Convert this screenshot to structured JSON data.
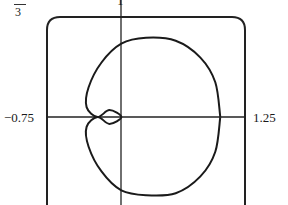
{
  "chart_data": {
    "type": "line",
    "title": "",
    "xlim": [
      -0.75,
      1.25
    ],
    "ylim": [
      -0.9,
      1
    ],
    "x_tick_labels": [
      "-0.75",
      "1.25"
    ],
    "y_tick_labels": [
      "1"
    ],
    "top_left_fragment": "3",
    "grid": false,
    "legend": null,
    "series": [
      {
        "name": "polar curve",
        "points": [
          [
            1.0,
            0.0
          ],
          [
            0.95,
            0.35
          ],
          [
            0.8,
            0.6
          ],
          [
            0.55,
            0.77
          ],
          [
            0.25,
            0.8
          ],
          [
            0.0,
            0.74
          ],
          [
            -0.2,
            0.55
          ],
          [
            -0.33,
            0.3
          ],
          [
            -0.35,
            0.1
          ],
          [
            -0.24,
            0.0
          ],
          [
            -0.12,
            0.07
          ],
          [
            0.0,
            0.0
          ],
          [
            -0.12,
            -0.07
          ],
          [
            -0.24,
            0.0
          ],
          [
            -0.35,
            -0.1
          ],
          [
            -0.33,
            -0.3
          ],
          [
            -0.2,
            -0.55
          ],
          [
            0.0,
            -0.74
          ],
          [
            0.25,
            -0.79
          ],
          [
            0.55,
            -0.77
          ],
          [
            0.8,
            -0.6
          ],
          [
            0.95,
            -0.35
          ],
          [
            1.0,
            0.0
          ]
        ]
      }
    ]
  },
  "labels": {
    "x_min": "−0.75",
    "x_max": "1.25",
    "y_max": "1",
    "fraction_den": "3"
  }
}
